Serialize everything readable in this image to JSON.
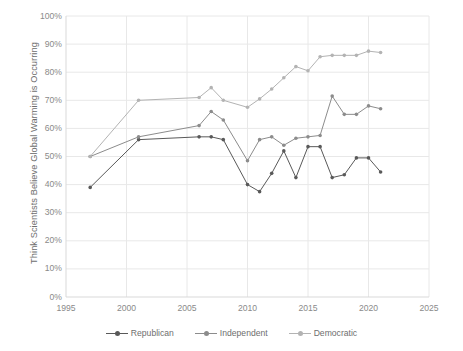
{
  "chart_data": {
    "type": "line",
    "title": "",
    "xlabel": "",
    "ylabel": "Think Scientists Believe Global Warming is Occurring",
    "xlim": [
      1995,
      2025
    ],
    "ylim": [
      0,
      1
    ],
    "xticks": [
      "1995",
      "2000",
      "2005",
      "2010",
      "2015",
      "2020",
      "2025"
    ],
    "yticks": [
      "0%",
      "10%",
      "20%",
      "30%",
      "40%",
      "50%",
      "60%",
      "70%",
      "80%",
      "90%",
      "100%"
    ],
    "grid": true,
    "legend_position": "bottom",
    "series": [
      {
        "name": "Republican",
        "color": "#595959",
        "x": [
          1997,
          2001,
          2006,
          2007,
          2008,
          2010,
          2011,
          2012,
          2013,
          2014,
          2015,
          2016,
          2017,
          2018,
          2019,
          2020,
          2021
        ],
        "values": [
          39,
          56,
          57,
          57,
          56,
          40,
          37.5,
          44,
          52,
          42.5,
          53.5,
          53.5,
          42.5,
          43.5,
          49.5,
          49.5,
          44.5
        ]
      },
      {
        "name": "Independent",
        "color": "#8c8c8c",
        "x": [
          1997,
          2001,
          2006,
          2007,
          2008,
          2010,
          2011,
          2012,
          2013,
          2014,
          2015,
          2016,
          2017,
          2018,
          2019,
          2020,
          2021
        ],
        "values": [
          50,
          57,
          61,
          66,
          63,
          48.5,
          56,
          57,
          54,
          56.5,
          57,
          57.5,
          71.5,
          65,
          65,
          68,
          67
        ]
      },
      {
        "name": "Democratic",
        "color": "#b3b3b3",
        "x": [
          1997,
          2001,
          2006,
          2007,
          2008,
          2010,
          2011,
          2012,
          2013,
          2014,
          2015,
          2016,
          2017,
          2018,
          2019,
          2020,
          2021
        ],
        "values": [
          50,
          70,
          71,
          74.5,
          70,
          67.5,
          70.5,
          74,
          78,
          82,
          80.5,
          85.5,
          86,
          86,
          86,
          87.5,
          87
        ]
      }
    ]
  },
  "legend": {
    "items": [
      {
        "label": "Republican"
      },
      {
        "label": "Independent"
      },
      {
        "label": "Democratic"
      }
    ]
  },
  "colors": {
    "republican": "#595959",
    "independent": "#8c8c8c",
    "democratic": "#b3b3b3",
    "grid": "#e8e8e8",
    "axis": "#d9d9d9",
    "text": "#8a8a8a"
  }
}
